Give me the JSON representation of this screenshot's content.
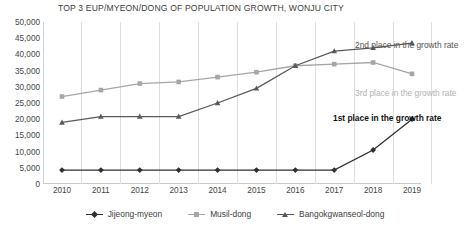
{
  "chart_data": {
    "type": "line",
    "title": "TOP 3 EUP/MYEON/DONG OF POPULATION GROWTH, WONJU CITY",
    "xlabel": "",
    "ylabel": "",
    "categories": [
      "2010",
      "2011",
      "2012",
      "2013",
      "2014",
      "2015",
      "2016",
      "2017",
      "2018",
      "2019"
    ],
    "ylim": [
      0,
      50000
    ],
    "ytick_labels": [
      "50,000",
      "45,000",
      "40,000",
      "35,000",
      "30,000",
      "25,000",
      "20,000",
      "15,000",
      "10,000",
      "5,000",
      "0"
    ],
    "ytick_values": [
      50000,
      45000,
      40000,
      35000,
      30000,
      25000,
      20000,
      15000,
      10000,
      5000,
      0
    ],
    "grid": "vertical",
    "legend_position": "bottom",
    "series": [
      {
        "name": "Jijeong-myeon",
        "marker": "diamond",
        "color": "#2f2f2f",
        "values": [
          4300,
          4300,
          4300,
          4300,
          4300,
          4300,
          4300,
          4300,
          10500,
          20000
        ]
      },
      {
        "name": "Musil-dong",
        "marker": "square",
        "color": "#a6a6a6",
        "values": [
          27000,
          29000,
          31000,
          31500,
          33000,
          34500,
          36500,
          37000,
          37500,
          34000
        ]
      },
      {
        "name": "Bangokgwanseol-dong",
        "marker": "triangle",
        "color": "#595959",
        "values": [
          19000,
          20800,
          20800,
          20800,
          25000,
          29500,
          36500,
          41000,
          42000,
          43500
        ]
      }
    ],
    "annotations": [
      {
        "id": "second-place",
        "text": "2nd place in the growth rate",
        "color": "#555555"
      },
      {
        "id": "third-place",
        "text": "3rd place in the growth rate",
        "color": "#b2b2b2"
      },
      {
        "id": "first-place",
        "text": "1st place in the growth rate",
        "color": "#111111"
      }
    ]
  }
}
